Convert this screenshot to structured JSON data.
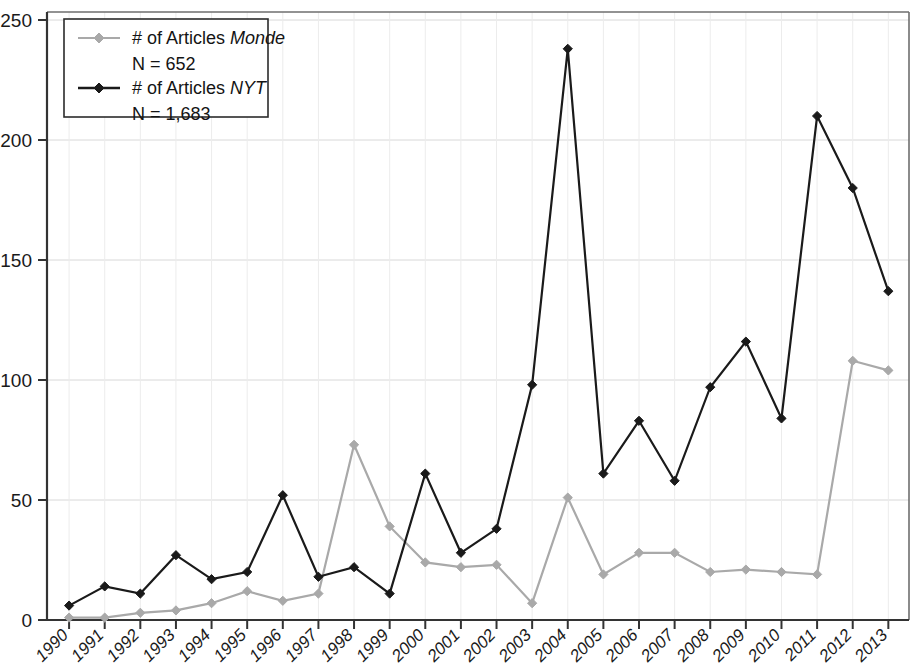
{
  "chart_data": {
    "type": "line",
    "title": "",
    "xlabel": "",
    "ylabel": "",
    "ylim": [
      0,
      250
    ],
    "yticks": [
      0,
      50,
      100,
      150,
      200,
      250
    ],
    "grid": true,
    "legend_position": "top-left",
    "categories": [
      "1990",
      "1991",
      "1992",
      "1993",
      "1994",
      "1995",
      "1996",
      "1997",
      "1998",
      "1999",
      "2000",
      "2001",
      "2002",
      "2003",
      "2004",
      "2005",
      "2006",
      "2007",
      "2008",
      "2009",
      "2010",
      "2011",
      "2012",
      "2013"
    ],
    "series": [
      {
        "name": "# of Articles Monde",
        "name_plain": "# of Articles ",
        "name_italic": "Monde",
        "count_label": "N = 652",
        "total": 652,
        "color": "#a9a9a9",
        "marker": "diamond",
        "values": [
          1,
          1,
          3,
          4,
          7,
          12,
          8,
          11,
          73,
          39,
          24,
          22,
          23,
          7,
          51,
          19,
          28,
          28,
          20,
          21,
          20,
          19,
          108,
          104
        ]
      },
      {
        "name": "# of Articles NYT",
        "name_plain": "# of Articles ",
        "name_italic": "NYT",
        "count_label": "N = 1,683",
        "total": 1683,
        "color": "#1a1a1a",
        "marker": "diamond",
        "values": [
          6,
          14,
          11,
          27,
          17,
          20,
          52,
          18,
          22,
          11,
          61,
          28,
          38,
          98,
          238,
          61,
          83,
          58,
          97,
          116,
          84,
          210,
          180,
          137
        ]
      }
    ]
  },
  "axis": {
    "y_labels": [
      "250",
      "200",
      "150",
      "100",
      "50",
      "0"
    ],
    "x_labels": [
      "1990",
      "1991",
      "1992",
      "1993",
      "1994",
      "1995",
      "1996",
      "1997",
      "1998",
      "1999",
      "2000",
      "2001",
      "2002",
      "2003",
      "2004",
      "2005",
      "2006",
      "2007",
      "2008",
      "2009",
      "2010",
      "2011",
      "2012",
      "2013"
    ]
  },
  "legend": {
    "entries": [
      {
        "label_plain": "# of Articles ",
        "label_italic": "Monde",
        "count": "N = 652",
        "swatch": "monde-line-swatch"
      },
      {
        "label_plain": "# of Articles ",
        "label_italic": "NYT",
        "count": "N = 1,683",
        "swatch": "nyt-line-swatch"
      }
    ]
  },
  "colors": {
    "monde": "#a9a9a9",
    "nyt": "#1a1a1a",
    "axis": "#3a3a3a",
    "grid": "#d8d8d8",
    "frame": "#7a7a7a",
    "background": "#ffffff"
  }
}
